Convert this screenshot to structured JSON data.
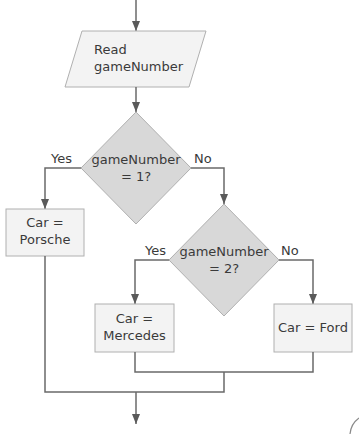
{
  "diagram": {
    "type": "flowchart",
    "nodes": {
      "input": {
        "shape": "parallelogram",
        "line1": "Read",
        "line2": "gameNumber"
      },
      "decision1": {
        "shape": "diamond",
        "line1": "gameNumber",
        "line2": "= 1?"
      },
      "decision2": {
        "shape": "diamond",
        "line1": "gameNumber",
        "line2": "= 2?"
      },
      "porsche": {
        "shape": "rectangle",
        "line1": "Car =",
        "line2": "Porsche"
      },
      "mercedes": {
        "shape": "rectangle",
        "line1": "Car =",
        "line2": "Mercedes"
      },
      "ford": {
        "shape": "rectangle",
        "line1": "Car = Ford"
      }
    },
    "edges": {
      "d1_yes": "Yes",
      "d1_no": "No",
      "d2_yes": "Yes",
      "d2_no": "No"
    },
    "colors": {
      "decision_fill": "#d8d8d8",
      "box_fill": "#f3f3f3",
      "stroke": "#a8a8a8",
      "arrow": "#5a5a5a",
      "text": "#3a3a3a"
    }
  }
}
